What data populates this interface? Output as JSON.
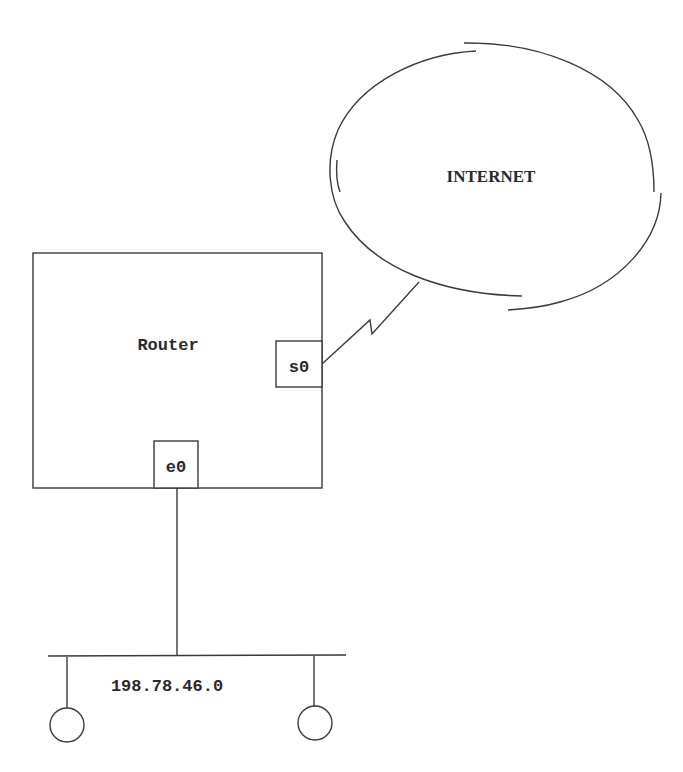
{
  "diagram": {
    "internet": {
      "label": "INTERNET"
    },
    "router": {
      "label": "Router",
      "ports": {
        "serial": "s0",
        "ethernet": "e0"
      }
    },
    "lan": {
      "network_address": "198.78.46.0",
      "hosts": [
        {
          "name": "host-1"
        },
        {
          "name": "host-2"
        }
      ]
    },
    "colors": {
      "stroke": "#3a3a3a",
      "text": "#2a2a2a",
      "background": "#ffffff"
    }
  }
}
